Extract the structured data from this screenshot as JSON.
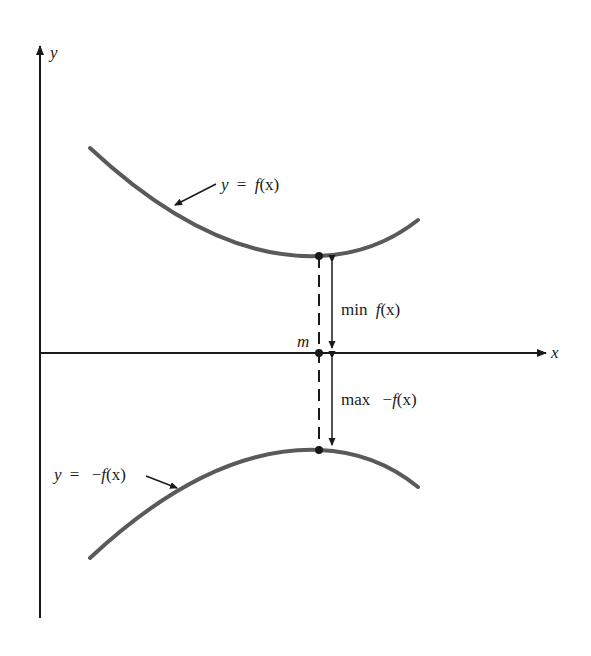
{
  "diagram": {
    "type": "function-graph",
    "axes": {
      "x_label": "x",
      "y_label": "y"
    },
    "curves": [
      {
        "id": "f",
        "label": "y = f(x)",
        "shape": "convex, minimum at m",
        "color": "#5a5a5a"
      },
      {
        "id": "neg_f",
        "label": "y = −f(x)",
        "shape": "concave, maximum at m",
        "color": "#5a5a5a"
      }
    ],
    "point_label": "m",
    "annotations": {
      "min_label": "min f(x)",
      "max_label": "max −f(x)"
    },
    "colors": {
      "curve": "#5a5a5a",
      "axis": "#1a1a1a",
      "background": "#ffffff"
    }
  },
  "labels": {
    "y_axis": "y",
    "x_axis": "x",
    "m": "m",
    "top_curve_y": "y",
    "top_curve_eq": "=",
    "top_curve_f": "f",
    "top_curve_arg": "(x)",
    "bot_curve_y": "y",
    "bot_curve_eq": "=",
    "bot_curve_minus": "−",
    "bot_curve_f": "f",
    "bot_curve_arg": "(x)",
    "min_word": "min",
    "min_f": "f",
    "min_arg": "(x)",
    "max_word": "max",
    "max_minus": "−",
    "max_f": "f",
    "max_arg": "(x)"
  }
}
